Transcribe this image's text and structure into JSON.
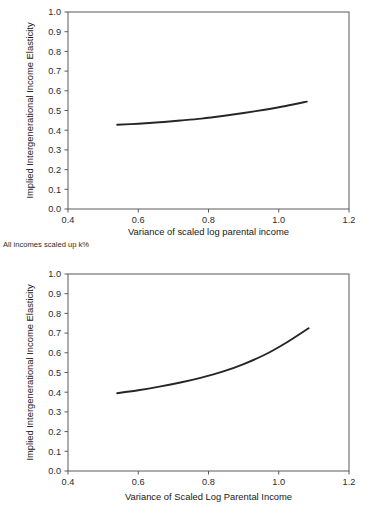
{
  "figure": {
    "note": "All incomes scaled up k%"
  },
  "chart_data": [
    {
      "type": "line",
      "id": "top",
      "title": "",
      "xlabel": "Variance of scaled log parental income",
      "ylabel": "Implied Intergenerational Income Elasticity",
      "xlim": [
        0.4,
        1.2
      ],
      "ylim": [
        0.0,
        1.0
      ],
      "xticks": [
        0.4,
        0.6,
        0.8,
        1.0,
        1.2
      ],
      "xtick_labels": [
        "0.4",
        "0.6",
        "0.8",
        "1.0",
        "1.2"
      ],
      "yticks": [
        0.0,
        0.1,
        0.2,
        0.3,
        0.4,
        0.5,
        0.6,
        0.7,
        0.8,
        0.9,
        1.0
      ],
      "ytick_labels": [
        "0.0",
        "0.1",
        "0.2",
        "0.3",
        "0.4",
        "0.5",
        "0.6",
        "0.7",
        "0.8",
        "0.9",
        "1.0"
      ],
      "grid": false,
      "legend": "none",
      "series": [
        {
          "name": "Implied elasticity",
          "color": "#262626",
          "x": [
            0.54,
            0.6,
            0.66,
            0.72,
            0.78,
            0.84,
            0.9,
            0.96,
            1.02,
            1.08
          ],
          "y": [
            0.428,
            0.433,
            0.44,
            0.449,
            0.459,
            0.472,
            0.487,
            0.504,
            0.523,
            0.545
          ]
        }
      ]
    },
    {
      "type": "line",
      "id": "bottom",
      "title": "",
      "xlabel": "Variance of Scaled Log Parental Income",
      "ylabel": "Implied Intergenerational Income Elasticity",
      "xlim": [
        0.4,
        1.2
      ],
      "ylim": [
        0.0,
        1.0
      ],
      "xticks": [
        0.4,
        0.6,
        0.8,
        1.0,
        1.2
      ],
      "xtick_labels": [
        "0.4",
        "0.6",
        "0.8",
        "1.0",
        "1.2"
      ],
      "yticks": [
        0.0,
        0.1,
        0.2,
        0.3,
        0.4,
        0.5,
        0.6,
        0.7,
        0.8,
        0.9,
        1.0
      ],
      "ytick_labels": [
        "0.0",
        "0.1",
        "0.2",
        "0.3",
        "0.4",
        "0.5",
        "0.6",
        "0.7",
        "0.8",
        "0.9",
        "1.0"
      ],
      "grid": false,
      "legend": "none",
      "series": [
        {
          "name": "Implied elasticity",
          "color": "#262626",
          "x": [
            0.54,
            0.6,
            0.66,
            0.72,
            0.78,
            0.84,
            0.9,
            0.96,
            1.02,
            1.085
          ],
          "y": [
            0.395,
            0.41,
            0.428,
            0.449,
            0.474,
            0.504,
            0.543,
            0.59,
            0.65,
            0.725
          ]
        }
      ]
    }
  ]
}
